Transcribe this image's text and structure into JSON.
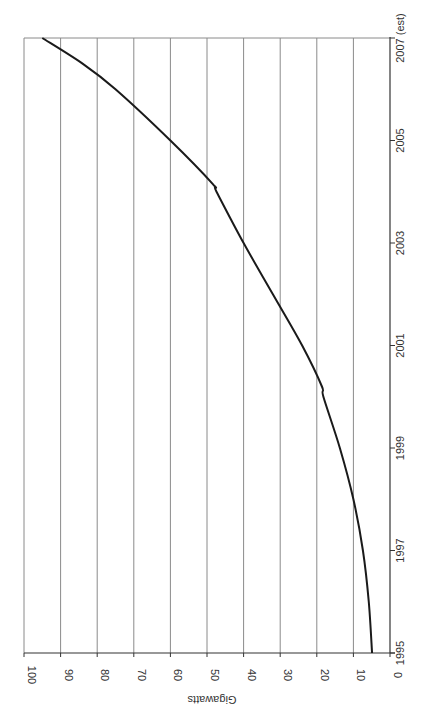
{
  "chart_data": {
    "type": "line",
    "orientation": "rotated-90-ccw",
    "title": "",
    "xlabel": "",
    "ylabel": "Gigawatts",
    "x_tick_labels": [
      "1995",
      "1997",
      "1999",
      "2001",
      "2003",
      "2005",
      "2007 (est)"
    ],
    "x_tick_values": [
      1995,
      1997,
      1999,
      2001,
      2003,
      2005,
      2007
    ],
    "y_tick_labels": [
      "0",
      "10",
      "20",
      "30",
      "40",
      "50",
      "60",
      "70",
      "80",
      "90",
      "100"
    ],
    "y_tick_values": [
      0,
      10,
      20,
      30,
      40,
      50,
      60,
      70,
      80,
      90,
      100
    ],
    "xlim": [
      1995,
      2007
    ],
    "ylim": [
      0,
      100
    ],
    "grid": "horizontal-value-gridlines",
    "legend": "none",
    "series": [
      {
        "name": "Gigawatts",
        "color": "#1a1a1a",
        "x": [
          1995,
          1996,
          1997,
          1998,
          1999,
          2000,
          2000.2,
          2001,
          2002,
          2003,
          2004,
          2004.15,
          2005,
          2006,
          2006.5,
          2007
        ],
        "values": [
          4.9,
          5.8,
          7.4,
          10,
          13.7,
          18.2,
          18.6,
          24,
          32,
          40,
          47.4,
          48.4,
          60,
          75,
          84,
          95
        ]
      }
    ]
  }
}
